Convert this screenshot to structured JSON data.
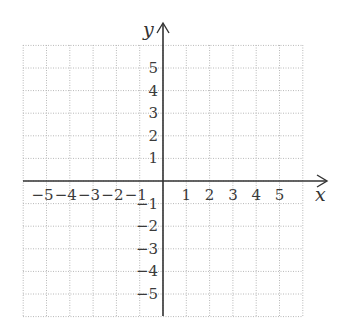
{
  "chart_data": {
    "type": "coordinate-grid",
    "title": "",
    "xlabel": "x",
    "ylabel": "y",
    "xlim": [
      -6,
      6
    ],
    "ylim": [
      -6,
      6
    ],
    "grid": true,
    "grid_style": "dotted",
    "x_ticks": [
      -5,
      -4,
      -3,
      -2,
      -1,
      1,
      2,
      3,
      4,
      5
    ],
    "y_ticks": [
      5,
      4,
      3,
      2,
      1,
      -1,
      -2,
      -3,
      -4,
      -5
    ],
    "x_tick_labels": [
      "−5",
      "−4",
      "−3",
      "−2",
      "−1",
      "1",
      "2",
      "3",
      "4",
      "5"
    ],
    "y_tick_labels": [
      "5",
      "4",
      "3",
      "2",
      "1",
      "−1",
      "−2",
      "−3",
      "−4",
      "−5"
    ],
    "series": [],
    "colors": {
      "grid": "#b8b8b8",
      "axis": "#333333",
      "text": "#3a3a3a"
    }
  },
  "axes": {
    "x_name": "x",
    "y_name": "y"
  }
}
